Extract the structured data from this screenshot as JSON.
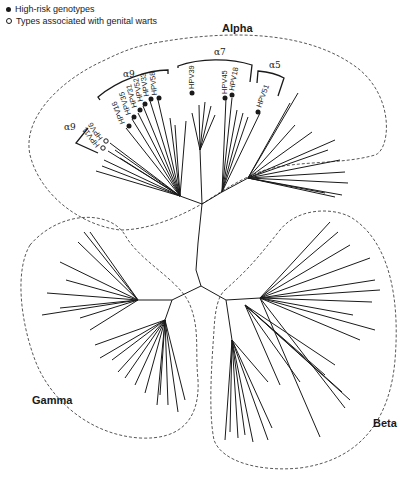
{
  "legend": {
    "items": [
      {
        "marker": "filled-circle",
        "label": "High-risk genotypes"
      },
      {
        "marker": "open-circle",
        "label": "Types associated with genital warts"
      }
    ]
  },
  "clades": {
    "alpha": {
      "label": "Alpha"
    },
    "beta": {
      "label": "Beta"
    },
    "gamma": {
      "label": "Gamma"
    }
  },
  "species_groups": [
    {
      "label": "α9",
      "members": [
        "HPV16",
        "HPV35",
        "HPV31",
        "HPV52",
        "HPV33",
        "HPV58"
      ],
      "marker": "filled"
    },
    {
      "label": "α9",
      "members": [
        "HPV6",
        "HPV11"
      ],
      "marker": "open"
    },
    {
      "label": "α7",
      "members": [
        "HPV39",
        "HPV45",
        "HPV18"
      ],
      "marker": "filled"
    },
    {
      "label": "α5",
      "members": [
        "HPV51"
      ],
      "marker": "filled"
    }
  ],
  "tips": {
    "hpv16": "HPV16",
    "hpv35": "HPV35",
    "hpv31": "HPV31",
    "hpv52": "HPV52",
    "hpv33": "HPV33",
    "hpv58": "HPV58",
    "hpv6": "HPV6",
    "hpv11": "HPV11",
    "hpv39": "HPV39",
    "hpv45": "HPV45",
    "hpv18": "HPV18",
    "hpv51": "HPV51"
  },
  "brackets": {
    "a9_top": "α9",
    "a9_bottom": "α9",
    "a7": "α7",
    "a5": "α5"
  }
}
